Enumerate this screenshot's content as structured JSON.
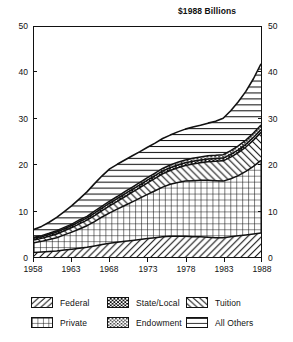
{
  "chart_data": {
    "type": "area",
    "title": "$1988 Billions",
    "xlabel": "",
    "ylabel": "",
    "xlim": [
      1958,
      1988
    ],
    "ylim": [
      0,
      50
    ],
    "grid": false,
    "stacked": true,
    "legend_position": "bottom",
    "x_ticks": [
      "1958",
      "1963",
      "1968",
      "1973",
      "1978",
      "1983",
      "1988"
    ],
    "y_ticks": [
      "0",
      "10",
      "20",
      "30",
      "40",
      "50"
    ],
    "y_ticks_right": [
      "0",
      "10",
      "20",
      "30",
      "40",
      "50"
    ],
    "x": [
      1958,
      1959,
      1960,
      1961,
      1962,
      1963,
      1964,
      1965,
      1966,
      1967,
      1968,
      1969,
      1970,
      1971,
      1972,
      1973,
      1974,
      1975,
      1976,
      1977,
      1978,
      1979,
      1980,
      1981,
      1982,
      1983,
      1984,
      1985,
      1986,
      1987,
      1988
    ],
    "series": [
      {
        "name": "Federal",
        "pattern": "diagonal-nw-se",
        "values": [
          1.0,
          1.1,
          1.2,
          1.3,
          1.5,
          1.7,
          1.9,
          2.1,
          2.4,
          2.7,
          3.0,
          3.2,
          3.4,
          3.6,
          3.8,
          4.0,
          4.2,
          4.4,
          4.5,
          4.5,
          4.5,
          4.4,
          4.4,
          4.3,
          4.2,
          4.2,
          4.4,
          4.6,
          4.8,
          5.0,
          5.2
        ]
      },
      {
        "name": "Private",
        "pattern": "grid",
        "values": [
          2.1,
          2.3,
          2.6,
          2.9,
          3.3,
          3.7,
          4.2,
          4.7,
          5.3,
          6.0,
          6.6,
          7.2,
          7.8,
          8.4,
          9.0,
          9.6,
          10.2,
          10.8,
          11.3,
          11.7,
          12.0,
          12.2,
          12.3,
          12.4,
          12.4,
          12.3,
          12.6,
          13.1,
          13.8,
          14.7,
          15.8
        ]
      },
      {
        "name": "Tuition",
        "pattern": "diagonal-sw-ne",
        "values": [
          0.6,
          0.65,
          0.7,
          0.8,
          0.9,
          1.0,
          1.1,
          1.2,
          1.3,
          1.4,
          1.5,
          1.7,
          1.9,
          2.1,
          2.3,
          2.5,
          2.7,
          2.9,
          3.0,
          3.2,
          3.4,
          3.6,
          3.8,
          4.0,
          4.2,
          4.4,
          4.7,
          5.0,
          5.3,
          5.7,
          6.1
        ]
      },
      {
        "name": "State/Local",
        "pattern": "dense-checker",
        "values": [
          0.35,
          0.35,
          0.4,
          0.4,
          0.45,
          0.45,
          0.5,
          0.5,
          0.55,
          0.55,
          0.6,
          0.6,
          0.6,
          0.6,
          0.6,
          0.6,
          0.6,
          0.6,
          0.6,
          0.6,
          0.6,
          0.6,
          0.6,
          0.6,
          0.6,
          0.6,
          0.6,
          0.6,
          0.6,
          0.6,
          0.6
        ]
      },
      {
        "name": "Endowment",
        "pattern": "dotted",
        "values": [
          0.25,
          0.25,
          0.25,
          0.3,
          0.3,
          0.3,
          0.35,
          0.35,
          0.4,
          0.4,
          0.45,
          0.45,
          0.5,
          0.5,
          0.5,
          0.55,
          0.55,
          0.55,
          0.6,
          0.6,
          0.6,
          0.65,
          0.65,
          0.7,
          0.7,
          0.75,
          0.8,
          0.85,
          0.9,
          0.95,
          1.0
        ]
      },
      {
        "name": "All Others",
        "pattern": "horizontal",
        "values": [
          1.7,
          2.0,
          2.4,
          2.9,
          3.4,
          4.0,
          4.6,
          5.3,
          6.0,
          6.6,
          7.0,
          7.0,
          6.9,
          6.8,
          6.7,
          6.6,
          6.5,
          6.5,
          6.5,
          6.6,
          6.7,
          6.8,
          6.9,
          7.1,
          7.4,
          7.9,
          8.7,
          9.6,
          10.6,
          11.8,
          13.3
        ]
      }
    ],
    "totals": [
      6.0,
      6.65,
      7.55,
      8.6,
      9.85,
      11.15,
      12.65,
      14.15,
      15.95,
      17.65,
      19.15,
      20.15,
      21.1,
      22.0,
      22.9,
      23.85,
      24.75,
      25.75,
      26.5,
      27.2,
      27.8,
      28.25,
      28.65,
      29.1,
      29.5,
      30.15,
      31.8,
      33.75,
      36.0,
      38.75,
      41.9
    ]
  },
  "legend": {
    "items": [
      {
        "label": "Federal",
        "pattern": "diagonal-nw-se"
      },
      {
        "label": "State/Local",
        "pattern": "dense-checker"
      },
      {
        "label": "Tuition",
        "pattern": "diagonal-sw-ne"
      },
      {
        "label": "Private",
        "pattern": "grid"
      },
      {
        "label": "Endowment",
        "pattern": "dotted"
      },
      {
        "label": "All Others",
        "pattern": "horizontal"
      }
    ]
  },
  "colors": {
    "ink": "#111111",
    "background": "#ffffff"
  }
}
